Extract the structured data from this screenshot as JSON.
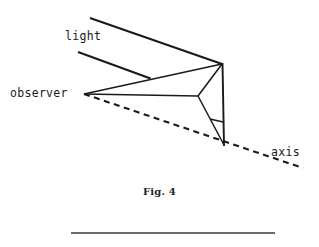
{
  "figure": {
    "caption": "Fig. 4",
    "labels": {
      "light": "light",
      "observer": "observer",
      "axis": "axis"
    },
    "colors": {
      "ink": "#1a1a1a",
      "background": "#ffffff",
      "rule": "#3a3a3a"
    },
    "geometry": {
      "apex": [
        222,
        64
      ],
      "bottom_vertex": [
        224,
        145
      ],
      "mid_junction": [
        198,
        96
      ],
      "observer_vertex": [
        84,
        94
      ],
      "light_ray_upper": [
        [
          90,
          18
        ],
        [
          222,
          64
        ]
      ],
      "light_ray_lower": [
        [
          78,
          52
        ],
        [
          150,
          79
        ]
      ],
      "axis_line": [
        [
          84,
          94
        ],
        [
          303,
          168
        ]
      ],
      "vertical_edge": [
        [
          222,
          64
        ],
        [
          224,
          145
        ]
      ],
      "rule": [
        [
          71,
          233
        ],
        [
          275,
          233
        ]
      ]
    }
  }
}
